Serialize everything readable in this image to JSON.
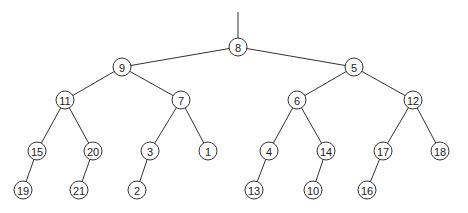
{
  "tree": {
    "root_stub": {
      "x": 238,
      "y1": 12,
      "y2": 38
    },
    "radius": 9,
    "nodes": [
      {
        "id": "n8",
        "label": "8",
        "x": 238,
        "y": 47
      },
      {
        "id": "n9",
        "label": "9",
        "x": 122,
        "y": 67
      },
      {
        "id": "n5",
        "label": "5",
        "x": 354,
        "y": 67
      },
      {
        "id": "n11",
        "label": "11",
        "x": 65,
        "y": 100
      },
      {
        "id": "n7",
        "label": "7",
        "x": 181,
        "y": 100
      },
      {
        "id": "n6",
        "label": "6",
        "x": 297,
        "y": 100
      },
      {
        "id": "n12",
        "label": "12",
        "x": 413,
        "y": 100
      },
      {
        "id": "n15",
        "label": "15",
        "x": 37,
        "y": 151
      },
      {
        "id": "n20",
        "label": "20",
        "x": 93,
        "y": 151
      },
      {
        "id": "n3",
        "label": "3",
        "x": 150,
        "y": 151
      },
      {
        "id": "n1",
        "label": "1",
        "x": 208,
        "y": 151
      },
      {
        "id": "n4",
        "label": "4",
        "x": 269,
        "y": 151
      },
      {
        "id": "n14",
        "label": "14",
        "x": 326,
        "y": 151
      },
      {
        "id": "n17",
        "label": "17",
        "x": 383,
        "y": 151
      },
      {
        "id": "n18",
        "label": "18",
        "x": 440,
        "y": 151
      },
      {
        "id": "n19",
        "label": "19",
        "x": 23,
        "y": 190
      },
      {
        "id": "n21",
        "label": "21",
        "x": 79,
        "y": 190
      },
      {
        "id": "n2",
        "label": "2",
        "x": 137,
        "y": 190
      },
      {
        "id": "n13",
        "label": "13",
        "x": 254,
        "y": 190
      },
      {
        "id": "n10",
        "label": "10",
        "x": 313,
        "y": 190
      },
      {
        "id": "n16",
        "label": "16",
        "x": 367,
        "y": 190
      }
    ],
    "edges": [
      [
        "n8",
        "n9"
      ],
      [
        "n8",
        "n5"
      ],
      [
        "n9",
        "n11"
      ],
      [
        "n9",
        "n7"
      ],
      [
        "n5",
        "n6"
      ],
      [
        "n5",
        "n12"
      ],
      [
        "n11",
        "n15"
      ],
      [
        "n11",
        "n20"
      ],
      [
        "n7",
        "n3"
      ],
      [
        "n7",
        "n1"
      ],
      [
        "n6",
        "n4"
      ],
      [
        "n6",
        "n14"
      ],
      [
        "n12",
        "n17"
      ],
      [
        "n12",
        "n18"
      ],
      [
        "n15",
        "n19"
      ],
      [
        "n20",
        "n21"
      ],
      [
        "n3",
        "n2"
      ],
      [
        "n4",
        "n13"
      ],
      [
        "n14",
        "n10"
      ],
      [
        "n17",
        "n16"
      ]
    ]
  }
}
